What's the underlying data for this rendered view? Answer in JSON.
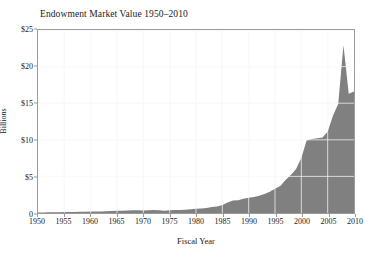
{
  "chart_data": {
    "type": "area",
    "title": "Endowment Market Value 1950–2010",
    "xlabel": "Fiscal Year",
    "ylabel": "Billions",
    "xlim": [
      1950,
      2010
    ],
    "ylim": [
      0,
      25
    ],
    "grid": true,
    "legend": "none",
    "fill_color": "#808080",
    "gridline_color": "#ffffff",
    "frame_color": "#9a9a9a",
    "y_tick_labels": [
      "$25",
      "$20",
      "$15",
      "$10",
      "$5",
      "0"
    ],
    "y_tick_values": [
      25,
      20,
      15,
      10,
      5,
      0
    ],
    "x_tick_labels": [
      "1950",
      "1955",
      "1960",
      "1965",
      "1970",
      "1975",
      "1980",
      "1985",
      "1990",
      "1995",
      "2000",
      "2005",
      "2010"
    ],
    "x_tick_values": [
      1950,
      1955,
      1960,
      1965,
      1970,
      1975,
      1980,
      1985,
      1990,
      1995,
      2000,
      2005,
      2010
    ],
    "x": [
      1950,
      1951,
      1952,
      1953,
      1954,
      1955,
      1956,
      1957,
      1958,
      1959,
      1960,
      1961,
      1962,
      1963,
      1964,
      1965,
      1966,
      1967,
      1968,
      1969,
      1970,
      1971,
      1972,
      1973,
      1974,
      1975,
      1976,
      1977,
      1978,
      1979,
      1980,
      1981,
      1982,
      1983,
      1984,
      1985,
      1986,
      1987,
      1988,
      1989,
      1990,
      1991,
      1992,
      1993,
      1994,
      1995,
      1996,
      1997,
      1998,
      1999,
      2000,
      2001,
      2002,
      2003,
      2004,
      2005,
      2006,
      2007,
      2008,
      2009,
      2010
    ],
    "values": [
      0.07,
      0.08,
      0.09,
      0.09,
      0.11,
      0.13,
      0.14,
      0.14,
      0.16,
      0.18,
      0.2,
      0.22,
      0.22,
      0.25,
      0.28,
      0.3,
      0.31,
      0.34,
      0.37,
      0.37,
      0.34,
      0.37,
      0.4,
      0.38,
      0.32,
      0.37,
      0.4,
      0.42,
      0.45,
      0.5,
      0.57,
      0.63,
      0.68,
      0.82,
      0.88,
      1.1,
      1.45,
      1.7,
      1.75,
      1.95,
      2.1,
      2.2,
      2.35,
      2.6,
      2.9,
      3.3,
      3.7,
      4.5,
      5.2,
      6.0,
      7.5,
      9.9,
      10.1,
      10.2,
      10.3,
      11.1,
      13.3,
      14.9,
      22.9,
      16.3,
      16.6
    ],
    "annotations": {
      "peak_year": 2008,
      "peak_value": 22.9,
      "trough_after_peak_year": 2009,
      "trough_after_peak_value": 16.3,
      "final_year": 2010,
      "final_value": 16.6
    }
  }
}
